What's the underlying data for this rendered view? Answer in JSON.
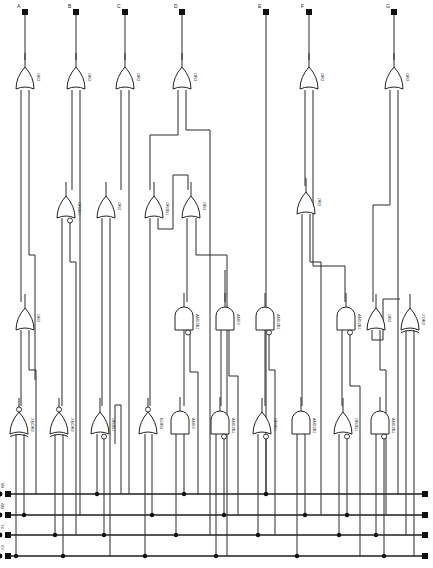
{
  "diagram": {
    "outputs": [
      {
        "label": "A",
        "x": 25
      },
      {
        "label": "B",
        "x": 76
      },
      {
        "label": "C",
        "x": 125
      },
      {
        "label": "D",
        "x": 182
      },
      {
        "label": "E",
        "x": 266
      },
      {
        "label": "F",
        "x": 309
      },
      {
        "label": "G",
        "x": 394
      }
    ],
    "inputs": [
      {
        "label": "W1",
        "y": 494
      },
      {
        "label": "W2",
        "y": 515
      },
      {
        "label": "X1",
        "y": 535
      },
      {
        "label": "X2",
        "y": 556
      }
    ],
    "gates": [
      {
        "id": "g1",
        "type": "OR",
        "label": "OR2",
        "x": 25,
        "y": 75
      },
      {
        "id": "g2",
        "type": "OR",
        "label": "OR2",
        "x": 76,
        "y": 75
      },
      {
        "id": "g3",
        "type": "OR",
        "label": "OR2",
        "x": 125,
        "y": 75
      },
      {
        "id": "g4",
        "type": "OR",
        "label": "OR3",
        "x": 182,
        "y": 75
      },
      {
        "id": "g5",
        "type": "OR",
        "label": "OR2",
        "x": 309,
        "y": 75
      },
      {
        "id": "g6",
        "type": "OR",
        "label": "OR2",
        "x": 394,
        "y": 75
      },
      {
        "id": "g7",
        "type": "OR",
        "label": "OR2B1",
        "x": 66,
        "y": 204,
        "bubble": true
      },
      {
        "id": "g8",
        "type": "OR",
        "label": "OR2",
        "x": 106,
        "y": 204
      },
      {
        "id": "g9",
        "type": "OR",
        "label": "OR2B1",
        "x": 154,
        "y": 204
      },
      {
        "id": "g10",
        "type": "OR",
        "label": "OR2",
        "x": 191,
        "y": 204
      },
      {
        "id": "g11",
        "type": "OR",
        "label": "OR2",
        "x": 306,
        "y": 200
      },
      {
        "id": "g12",
        "type": "OR",
        "label": "OR2",
        "x": 25,
        "y": 316
      },
      {
        "id": "g13",
        "type": "AND",
        "label": "AND2B1",
        "x": 184,
        "y": 316,
        "bubble": true
      },
      {
        "id": "g14",
        "type": "AND",
        "label": "AND2",
        "x": 225,
        "y": 316
      },
      {
        "id": "g15",
        "type": "AND",
        "label": "AND2B1",
        "x": 265,
        "y": 316,
        "bubble": true
      },
      {
        "id": "g16",
        "type": "AND",
        "label": "AND2B1",
        "x": 346,
        "y": 316,
        "bubble": true
      },
      {
        "id": "g17",
        "type": "OR",
        "label": "OR2",
        "x": 376,
        "y": 316
      },
      {
        "id": "g18",
        "type": "XOR",
        "label": "XOR2",
        "x": 410,
        "y": 316
      },
      {
        "id": "g19",
        "type": "XNOR",
        "label": "XNOR2",
        "x": 19,
        "y": 420
      },
      {
        "id": "g20",
        "type": "XNOR",
        "label": "XNOR2",
        "x": 59,
        "y": 420
      },
      {
        "id": "g21",
        "type": "OR",
        "label": "OR2B1",
        "x": 100,
        "y": 420,
        "bubble": true
      },
      {
        "id": "g22",
        "type": "NOR",
        "label": "NOR2",
        "x": 148,
        "y": 420
      },
      {
        "id": "g23",
        "type": "AND",
        "label": "AND2",
        "x": 180,
        "y": 420
      },
      {
        "id": "g24",
        "type": "AND",
        "label": "AND2B1",
        "x": 220,
        "y": 420,
        "bubble": true
      },
      {
        "id": "g25",
        "type": "OR",
        "label": "OR2B1",
        "x": 262,
        "y": 420,
        "bubble": true
      },
      {
        "id": "g26",
        "type": "AND",
        "label": "AND2B1",
        "x": 301,
        "y": 420
      },
      {
        "id": "g27",
        "type": "OR",
        "label": "OR2B1",
        "x": 343,
        "y": 420,
        "bubble": true
      },
      {
        "id": "g28",
        "type": "AND",
        "label": "AND2B1",
        "x": 380,
        "y": 420,
        "bubble": true
      }
    ],
    "wires": [
      "M25 14 L25 60",
      "M76 14 L76 60",
      "M125 14 L125 60",
      "M182 14 L182 60",
      "M266 14 L266 494",
      "M309 14 L309 60",
      "M394 14 L394 60",
      "M21 90 L21 302",
      "M29 90 L29 255 L35 255 L35 380",
      "M21 330 L21 406",
      "M29 330 L29 370 L36 370 L36 494",
      "M72 90 L72 190",
      "M80 90 L80 515",
      "M62 218 L62 406",
      "M70 218 L70 262 L76 262 L76 535",
      "M121 90 L121 190",
      "M129 90 L129 494",
      "M102 218 L102 406",
      "M110 218 L110 556",
      "M178 90 L178 135 L150 135 L150 190",
      "M186 90 L186 130 L210 130 L210 535",
      "M158 218 L158 229 L173 229 L173 175 L188 175 L188 190",
      "M150 218 L150 406",
      "M196 218 L196 255 L227 255 L227 556",
      "M187 218 L187 302",
      "M184 330 L184 406",
      "M190 330 L190 372 L198 372 L198 494",
      "M225 270 L225 302",
      "M221 330 L221 406",
      "M229 330 L229 376 L238 376 L238 515",
      "M305 90 L305 186",
      "M313 90 L313 266 L345 266 L345 302",
      "M302 214 L302 406",
      "M310 214 L310 262 L321 262 L321 515",
      "M265 330 L265 406",
      "M269 330 L269 370 L275 370 L275 535",
      "M342 330 L342 406",
      "M350 330 L350 386 L360 386 L360 556",
      "M390 90 L390 205 L373 205 L373 302",
      "M398 90 L398 494",
      "M372 330 L372 340 L383 340 L383 299 L400 299",
      "M380 330 L380 370 L386 370 L386 515",
      "M406 330 L406 535",
      "M414 330 L414 556",
      "M115 444 L115 405 L121 405 L121 494"
    ],
    "gate_inputs_to_bus": [
      {
        "x": 16,
        "bus": 3
      },
      {
        "x": 24,
        "bus": 1
      },
      {
        "x": 55,
        "bus": 2
      },
      {
        "x": 63,
        "bus": 3
      },
      {
        "x": 97,
        "bus": 0
      },
      {
        "x": 104,
        "bus": 2
      },
      {
        "x": 145,
        "bus": 3
      },
      {
        "x": 152,
        "bus": 1
      },
      {
        "x": 176,
        "bus": 2
      },
      {
        "x": 184,
        "bus": 0
      },
      {
        "x": 216,
        "bus": 3
      },
      {
        "x": 224,
        "bus": 1
      },
      {
        "x": 258,
        "bus": 2
      },
      {
        "x": 266,
        "bus": 0
      },
      {
        "x": 297,
        "bus": 3
      },
      {
        "x": 305,
        "bus": 1
      },
      {
        "x": 339,
        "bus": 2
      },
      {
        "x": 347,
        "bus": 1
      },
      {
        "x": 376,
        "bus": 2
      },
      {
        "x": 384,
        "bus": 3
      }
    ],
    "colors": {
      "ink": "#222222",
      "background": "#ffffff"
    }
  }
}
